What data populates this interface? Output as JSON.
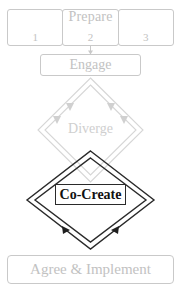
{
  "diagram": {
    "colors": {
      "light_stroke": "#c9c9c9",
      "light_text": "#c2c2c2",
      "diverge_stroke": "#d6d6d6",
      "diverge_text": "#cfcfcf",
      "cocreate_stroke": "#2a2a2a",
      "cocreate_text": "#111111",
      "background": "#ffffff"
    },
    "prepare": {
      "label": "Prepare",
      "cells": [
        {
          "number": "1"
        },
        {
          "number": "2"
        },
        {
          "number": "3"
        }
      ]
    },
    "engage": {
      "label": "Engage"
    },
    "diverge": {
      "label": "Diverge"
    },
    "cocreate": {
      "label": "Co-Create"
    },
    "agree": {
      "label": "Agree & Implement"
    }
  }
}
